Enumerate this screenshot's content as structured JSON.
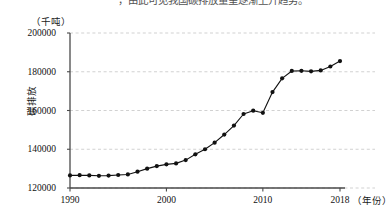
{
  "page": {
    "top_cut_text": "，由此可见我国碳排放量呈逐渐上升趋势。"
  },
  "chart_data": {
    "type": "line",
    "title": "",
    "subtitle": "",
    "xlabel": "（年份）",
    "ylabel": "碳排放",
    "y_unit": "（千吨）",
    "grid": true,
    "grid_axis": "y",
    "legend": "none",
    "marker": "filled-circle",
    "line_color": "#111111",
    "marker_color": "#111111",
    "grid_color": "#bdbdbd",
    "axis_color": "#4a4a4a",
    "xlim": [
      1990,
      2018
    ],
    "ylim": [
      120000,
      200000
    ],
    "y_ticks": [
      120000,
      140000,
      160000,
      180000,
      200000
    ],
    "y_tick_labels": [
      "120000",
      "140000",
      "160000",
      "180000",
      "200000"
    ],
    "x_ticks": [
      1990,
      2000,
      2010,
      2018
    ],
    "x_tick_labels": [
      "1990",
      "2000",
      "2010",
      "2018"
    ],
    "x": [
      1990,
      1991,
      1992,
      1993,
      1994,
      1995,
      1996,
      1997,
      1998,
      1999,
      2000,
      2001,
      2002,
      2003,
      2004,
      2005,
      2006,
      2007,
      2008,
      2009,
      2010,
      2011,
      2012,
      2013,
      2014,
      2015,
      2016,
      2017,
      2018
    ],
    "values": [
      126500,
      126600,
      126500,
      126300,
      126400,
      126700,
      127000,
      128400,
      130000,
      131300,
      132200,
      132700,
      134400,
      137400,
      140000,
      143400,
      147600,
      152200,
      158200,
      159900,
      158800,
      169500,
      176600,
      180400,
      180500,
      180200,
      180700,
      182700,
      185500
    ],
    "series": [
      {
        "name": "碳排放",
        "values": [
          126500,
          126600,
          126500,
          126300,
          126400,
          126700,
          127000,
          128400,
          130000,
          131300,
          132200,
          132700,
          134400,
          137400,
          140000,
          143400,
          147600,
          152200,
          158200,
          159900,
          158800,
          169500,
          176600,
          180400,
          180500,
          180200,
          180700,
          182700,
          185500
        ]
      }
    ]
  }
}
